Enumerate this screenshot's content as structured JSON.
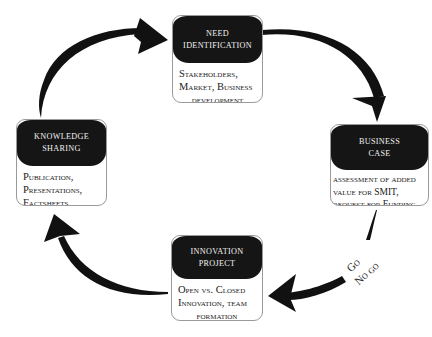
{
  "diagram": {
    "type": "cycle",
    "direction": "clockwise",
    "nodes": [
      {
        "id": "need",
        "title_lines": [
          "Need",
          "Identification"
        ],
        "body_lines": [
          "Stakeholders,",
          "Market, Business",
          "development"
        ]
      },
      {
        "id": "business",
        "title_lines": [
          "Business",
          "Case"
        ],
        "body_lines": [
          "assessment of added",
          "value for SMIT,",
          "request for Funding"
        ]
      },
      {
        "id": "innovation",
        "title_lines": [
          "Innovation",
          "Project"
        ],
        "body_lines": [
          "Open vs. Closed",
          "Innovation, team",
          "formation"
        ]
      },
      {
        "id": "knowledge",
        "title_lines": [
          "Knowledge",
          "Sharing"
        ],
        "body_lines": [
          "Publication,",
          "Presentations,",
          "Factsheets"
        ]
      }
    ],
    "edges": [
      {
        "from": "knowledge",
        "to": "need"
      },
      {
        "from": "need",
        "to": "business"
      },
      {
        "from": "business",
        "to": "innovation",
        "label_lines": [
          "Go",
          "No go"
        ]
      },
      {
        "from": "innovation",
        "to": "knowledge"
      }
    ],
    "colors": {
      "header": "#151515",
      "arrow": "#111111",
      "border": "#9a9a9a"
    }
  }
}
